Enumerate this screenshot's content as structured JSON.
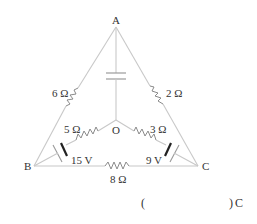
{
  "diagram": {
    "type": "circuit",
    "nodes": {
      "A": "A",
      "B": "B",
      "C": "C",
      "O": "O"
    },
    "components": {
      "r_AB": "6 Ω",
      "r_AC": "2 Ω",
      "r_BO": "5 Ω",
      "r_CO": "3 Ω",
      "r_BC": "8 Ω",
      "emf_B": "15 V",
      "emf_C": "9 V",
      "capacitor_AO": "capacitor"
    },
    "answer_blank": {
      "open": "(",
      "close": ")",
      "unit": "C"
    }
  }
}
